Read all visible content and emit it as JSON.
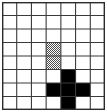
{
  "figure": {
    "type": "grid",
    "columns": 7,
    "rows": 8,
    "cell_size_px": 13.3,
    "colors": {
      "background": "#ffffff",
      "grid_line": "#3a3a3a",
      "border": "#2b2b2b",
      "empty_cell": "#ffffff",
      "shaded_cell": "#9a9a9a",
      "filled_cell": "#000000"
    },
    "legend": {
      "empty_label": "empty",
      "shaded_label": "shaded",
      "filled_label": "filled"
    },
    "cells": [
      [
        "empty",
        "empty",
        "empty",
        "empty",
        "empty",
        "empty",
        "empty"
      ],
      [
        "empty",
        "empty",
        "empty",
        "empty",
        "empty",
        "empty",
        "empty"
      ],
      [
        "empty",
        "empty",
        "empty",
        "empty",
        "empty",
        "empty",
        "empty"
      ],
      [
        "empty",
        "empty",
        "empty",
        "shaded",
        "empty",
        "empty",
        "empty"
      ],
      [
        "empty",
        "empty",
        "empty",
        "shaded",
        "empty",
        "empty",
        "empty"
      ],
      [
        "empty",
        "empty",
        "empty",
        "empty",
        "filled",
        "empty",
        "empty"
      ],
      [
        "empty",
        "empty",
        "empty",
        "filled",
        "filled",
        "filled",
        "empty"
      ],
      [
        "empty",
        "empty",
        "empty",
        "empty",
        "filled",
        "empty",
        "empty"
      ]
    ],
    "shaded_cells": [
      {
        "col": 4,
        "row": 4
      },
      {
        "col": 4,
        "row": 5
      }
    ],
    "filled_cells": [
      {
        "col": 5,
        "row": 6
      },
      {
        "col": 4,
        "row": 7
      },
      {
        "col": 5,
        "row": 7
      },
      {
        "col": 6,
        "row": 7
      },
      {
        "col": 5,
        "row": 8
      }
    ],
    "filled_shape_name": "plus-cross"
  }
}
